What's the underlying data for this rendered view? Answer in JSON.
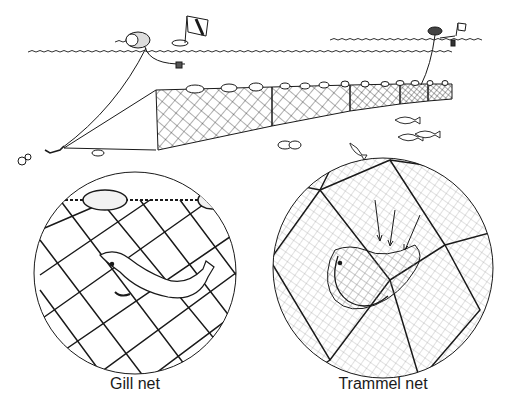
{
  "figure": {
    "type": "illustration"
  },
  "overview": {
    "elements": [
      "surface-float",
      "marker-buoy-flag",
      "float-line",
      "net-panels",
      "anchor",
      "fish",
      "rocks"
    ]
  },
  "insets": [
    {
      "id": "gill",
      "label": "Gill net",
      "depicts": "fish caught by gills in single-wall mesh"
    },
    {
      "id": "trammel",
      "label": "Trammel net",
      "depicts": "fish pocketed in fine inner mesh through coarse outer mesh, arrows showing direction"
    }
  ],
  "colors": {
    "ink": "#1a1a1a",
    "paper": "#ffffff",
    "light_ink": "#888888"
  }
}
